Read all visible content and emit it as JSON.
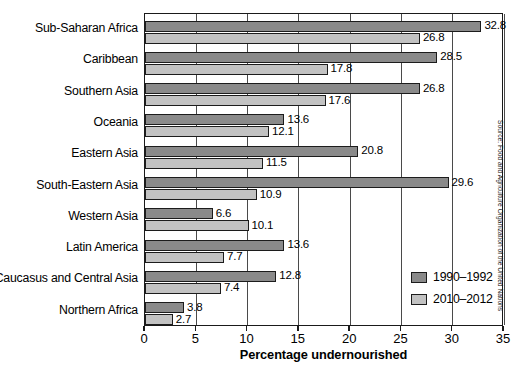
{
  "chart_data": {
    "type": "bar",
    "orientation": "horizontal",
    "title": "",
    "xlabel": "Percentage undernourished",
    "ylabel": "",
    "xlim": [
      0,
      35
    ],
    "xticks": [
      0,
      5,
      10,
      15,
      20,
      25,
      30,
      35
    ],
    "grid": true,
    "grid_axis": "x",
    "legend_position": "inside-bottom-right",
    "categories": [
      "Sub-Saharan Africa",
      "Caribbean",
      "Southern Asia",
      "Oceania",
      "Eastern Asia",
      "South-Eastern Asia",
      "Western Asia",
      "Latin America",
      "Caucasus and Central Asia",
      "Northern Africa"
    ],
    "series": [
      {
        "name": "1990–1992",
        "color": "#8a8a8a",
        "values": [
          32.8,
          28.5,
          26.8,
          13.6,
          20.8,
          29.6,
          6.6,
          13.6,
          12.8,
          3.8
        ]
      },
      {
        "name": "2010–2012",
        "color": "#c2c2c2",
        "values": [
          26.8,
          17.8,
          17.6,
          12.1,
          11.5,
          10.9,
          10.1,
          7.7,
          7.4,
          2.7
        ]
      }
    ],
    "value_labels": {
      "1990–1992": [
        "32.8",
        "28.5",
        "26.8",
        "13.6",
        "20.8",
        "29.6",
        "6.6",
        "13.6",
        "12.8",
        "3.8"
      ],
      "2010–2012": [
        "26.8",
        "17.8",
        "17.6",
        "12.1",
        "11.5",
        "10.9",
        "10.1",
        "7.7",
        "7.4",
        "2.7"
      ]
    },
    "annotations": [
      "Source: Food and Agriculture Organization of the United Nations"
    ]
  },
  "axis": {
    "x_title": "Percentage undernourished",
    "tick_labels": [
      "0",
      "5",
      "10",
      "15",
      "20",
      "25",
      "30",
      "35"
    ]
  },
  "legend": {
    "entries": [
      {
        "label": "1990–1992",
        "swatch": "#8a8a8a"
      },
      {
        "label": "2010–2012",
        "swatch": "#c2c2c2"
      }
    ]
  },
  "source": {
    "text": "Source: Food and Agriculture Organization of the United Nations"
  },
  "colors": {
    "series_1990": "#8a8a8a",
    "series_2010": "#c2c2c2",
    "axis": "#1a1a1a",
    "grid": "#4a4a4a",
    "background": "#ffffff"
  }
}
